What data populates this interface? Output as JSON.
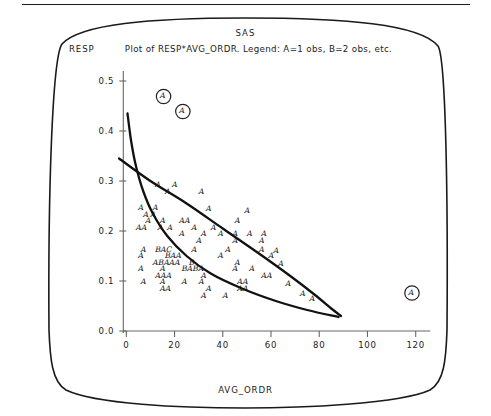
{
  "header": {
    "system_name": "SAS"
  },
  "plot": {
    "title": "Plot of RESP*AVG_ORDR. Legend: A=1 obs, B=2 obs, etc.",
    "ylabel": "RESP",
    "xlabel": "AVG_ORDR"
  },
  "chart_data": {
    "type": "scatter",
    "title": "Plot of RESP*AVG_ORDR. Legend: A=1 obs, B=2 obs, etc.",
    "xlabel": "AVG_ORDR",
    "ylabel": "RESP",
    "xlim": [
      -8,
      128
    ],
    "ylim": [
      -0.02,
      0.53
    ],
    "xticks": [
      0,
      20,
      40,
      60,
      80,
      100,
      120
    ],
    "xtick_labels": [
      "0",
      "20",
      "40",
      "60",
      "80",
      "100",
      "120"
    ],
    "yticks": [
      0.0,
      0.1,
      0.2,
      0.3,
      0.4,
      0.5
    ],
    "ytick_labels": [
      "0.0",
      "0.1",
      "0.2",
      "0.3",
      "0.4",
      "0.5"
    ],
    "grid": false,
    "legend": "A=1 obs, B=2 obs, etc.",
    "legend_position": "title",
    "marker_style": "letter-glyph",
    "points": [
      {
        "x": 14,
        "y": 0.47,
        "label": "A",
        "circled": true
      },
      {
        "x": 22,
        "y": 0.44,
        "label": "A",
        "circled": true
      },
      {
        "x": 117,
        "y": 0.077,
        "label": "A",
        "circled": true
      },
      {
        "x": 12,
        "y": 0.292,
        "label": "A",
        "circled": false
      },
      {
        "x": 19,
        "y": 0.292,
        "label": "A",
        "circled": false
      },
      {
        "x": 16,
        "y": 0.279,
        "label": "A",
        "circled": false
      },
      {
        "x": 30,
        "y": 0.279,
        "label": "A",
        "circled": false
      },
      {
        "x": 5,
        "y": 0.246,
        "label": "A",
        "circled": false
      },
      {
        "x": 11,
        "y": 0.246,
        "label": "A",
        "circled": false
      },
      {
        "x": 33,
        "y": 0.244,
        "label": "A",
        "circled": false
      },
      {
        "x": 7,
        "y": 0.233,
        "label": "A",
        "circled": false
      },
      {
        "x": 10,
        "y": 0.233,
        "label": "A",
        "circled": false
      },
      {
        "x": 8,
        "y": 0.22,
        "label": "A",
        "circled": false
      },
      {
        "x": 14,
        "y": 0.22,
        "label": "A",
        "circled": false
      },
      {
        "x": 22,
        "y": 0.22,
        "label": "AA",
        "circled": false
      },
      {
        "x": 45,
        "y": 0.22,
        "label": "A",
        "circled": false
      },
      {
        "x": 4,
        "y": 0.207,
        "label": "AA",
        "circled": false
      },
      {
        "x": 13,
        "y": 0.207,
        "label": "A",
        "circled": false
      },
      {
        "x": 17,
        "y": 0.207,
        "label": "A",
        "circled": false
      },
      {
        "x": 27,
        "y": 0.207,
        "label": "A",
        "circled": false
      },
      {
        "x": 35,
        "y": 0.207,
        "label": "A",
        "circled": false
      },
      {
        "x": 22,
        "y": 0.194,
        "label": "A",
        "circled": false
      },
      {
        "x": 31,
        "y": 0.194,
        "label": "A",
        "circled": false
      },
      {
        "x": 38,
        "y": 0.194,
        "label": "A",
        "circled": false
      },
      {
        "x": 44,
        "y": 0.194,
        "label": "A",
        "circled": false
      },
      {
        "x": 50,
        "y": 0.194,
        "label": "A",
        "circled": false
      },
      {
        "x": 56,
        "y": 0.194,
        "label": "A",
        "circled": false
      },
      {
        "x": 29,
        "y": 0.181,
        "label": "A",
        "circled": false
      },
      {
        "x": 44,
        "y": 0.181,
        "label": "A",
        "circled": false
      },
      {
        "x": 55,
        "y": 0.181,
        "label": "A",
        "circled": false
      },
      {
        "x": 6,
        "y": 0.163,
        "label": "A",
        "circled": false
      },
      {
        "x": 12,
        "y": 0.163,
        "label": "BAC",
        "circled": false
      },
      {
        "x": 27,
        "y": 0.163,
        "label": "A",
        "circled": false
      },
      {
        "x": 41,
        "y": 0.163,
        "label": "A",
        "circled": false
      },
      {
        "x": 55,
        "y": 0.163,
        "label": "A",
        "circled": false
      },
      {
        "x": 5,
        "y": 0.15,
        "label": "A",
        "circled": false
      },
      {
        "x": 16,
        "y": 0.15,
        "label": "BAA",
        "circled": false
      },
      {
        "x": 38,
        "y": 0.15,
        "label": "A",
        "circled": false
      },
      {
        "x": 59,
        "y": 0.15,
        "label": "A",
        "circled": false
      },
      {
        "x": 11,
        "y": 0.137,
        "label": "ABAAA",
        "circled": false
      },
      {
        "x": 26,
        "y": 0.137,
        "label": "B",
        "circled": false
      },
      {
        "x": 45,
        "y": 0.137,
        "label": "A",
        "circled": false
      },
      {
        "x": 5,
        "y": 0.124,
        "label": "A",
        "circled": false
      },
      {
        "x": 14,
        "y": 0.124,
        "label": "A",
        "circled": false
      },
      {
        "x": 23,
        "y": 0.124,
        "label": "BABA",
        "circled": false
      },
      {
        "x": 44,
        "y": 0.124,
        "label": "A",
        "circled": false
      },
      {
        "x": 51,
        "y": 0.124,
        "label": "A",
        "circled": false
      },
      {
        "x": 12,
        "y": 0.111,
        "label": "AAA",
        "circled": false
      },
      {
        "x": 31,
        "y": 0.111,
        "label": "A",
        "circled": false
      },
      {
        "x": 56,
        "y": 0.111,
        "label": "AA",
        "circled": false
      },
      {
        "x": 6,
        "y": 0.098,
        "label": "A",
        "circled": false
      },
      {
        "x": 14,
        "y": 0.098,
        "label": "A",
        "circled": false
      },
      {
        "x": 23,
        "y": 0.098,
        "label": "A",
        "circled": false
      },
      {
        "x": 30,
        "y": 0.098,
        "label": "A",
        "circled": false
      },
      {
        "x": 46,
        "y": 0.098,
        "label": "AA",
        "circled": false
      },
      {
        "x": 14,
        "y": 0.085,
        "label": "AA",
        "circled": false
      },
      {
        "x": 33,
        "y": 0.085,
        "label": "A",
        "circled": false
      },
      {
        "x": 46,
        "y": 0.085,
        "label": "AA",
        "circled": false
      },
      {
        "x": 31,
        "y": 0.07,
        "label": "A",
        "circled": false
      },
      {
        "x": 40,
        "y": 0.07,
        "label": "A",
        "circled": false
      },
      {
        "x": 66,
        "y": 0.095,
        "label": "A",
        "circled": false
      },
      {
        "x": 72,
        "y": 0.074,
        "label": "A",
        "circled": false
      },
      {
        "x": 76,
        "y": 0.064,
        "label": "A",
        "circled": false
      },
      {
        "x": 63,
        "y": 0.135,
        "label": "A",
        "circled": false
      },
      {
        "x": 61,
        "y": 0.16,
        "label": "A",
        "circled": false
      },
      {
        "x": 49,
        "y": 0.24,
        "label": "A",
        "circled": false
      }
    ],
    "curves": [
      {
        "name": "steep-decay-curve",
        "description": "steeply decaying convex curve from upper-left",
        "points": [
          [
            0.5,
            0.435
          ],
          [
            2,
            0.38
          ],
          [
            4,
            0.33
          ],
          [
            7,
            0.28
          ],
          [
            11,
            0.235
          ],
          [
            17,
            0.19
          ],
          [
            25,
            0.15
          ],
          [
            35,
            0.115
          ],
          [
            48,
            0.085
          ],
          [
            62,
            0.06
          ],
          [
            75,
            0.042
          ],
          [
            88,
            0.028
          ]
        ]
      },
      {
        "name": "upper-envelope-line",
        "description": "near-linear gently curving upper envelope",
        "points": [
          [
            -3,
            0.345
          ],
          [
            10,
            0.3
          ],
          [
            25,
            0.255
          ],
          [
            40,
            0.205
          ],
          [
            55,
            0.155
          ],
          [
            68,
            0.11
          ],
          [
            78,
            0.073
          ],
          [
            85,
            0.045
          ],
          [
            89,
            0.03
          ]
        ]
      }
    ]
  }
}
